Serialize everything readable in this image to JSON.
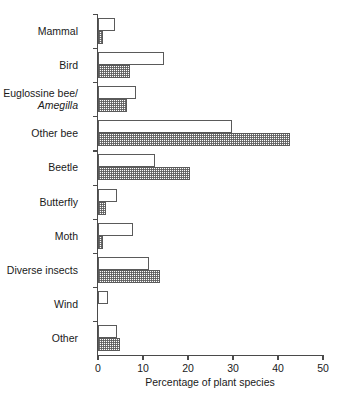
{
  "chart_data": {
    "type": "bar",
    "orientation": "horizontal",
    "title": "",
    "xlabel": "Percentage of plant species",
    "ylabel": "",
    "xlim": [
      0,
      50
    ],
    "xticks": [
      0,
      10,
      20,
      30,
      40,
      50
    ],
    "xtick_labels": [
      "0",
      "10",
      "20",
      "30",
      "40",
      "50"
    ],
    "grid": false,
    "legend": "none",
    "categories": [
      "Mammal",
      "Euglossine bee/Amegilla",
      "Bird",
      "Other bee",
      "Beetle",
      "Butterfly",
      "Moth",
      "Diverse insects",
      "Wind",
      "Other"
    ],
    "category_display": [
      {
        "line1": "Mammal",
        "line2": ""
      },
      {
        "line1": "Bird",
        "line2": ""
      },
      {
        "line1": "Euglossine bee/",
        "line2": "Amegilla"
      },
      {
        "line1": "Other bee",
        "line2": ""
      },
      {
        "line1": "Beetle",
        "line2": ""
      },
      {
        "line1": "Butterfly",
        "line2": ""
      },
      {
        "line1": "Moth",
        "line2": ""
      },
      {
        "line1": "Diverse insects",
        "line2": ""
      },
      {
        "line1": "Wind",
        "line2": ""
      },
      {
        "line1": "Other",
        "line2": ""
      }
    ],
    "series": [
      {
        "name": "open",
        "style": "white-fill",
        "values": [
          3.8,
          14.7,
          8.4,
          29.8,
          12.7,
          4.2,
          7.8,
          11.3,
          2.2,
          4.2
        ]
      },
      {
        "name": "hatched",
        "style": "stippled-fill",
        "values": [
          1.2,
          7.1,
          6.4,
          42.7,
          20.4,
          1.8,
          1.0,
          13.8,
          0,
          4.9
        ]
      }
    ],
    "colors": {
      "axis": "#4a4a4a",
      "bar_outline": "#5a5a5a",
      "open_fill": "#ffffff",
      "hatch_fill": "#5a5a5a",
      "text": "#1a1a1a",
      "background": "#ffffff"
    }
  }
}
